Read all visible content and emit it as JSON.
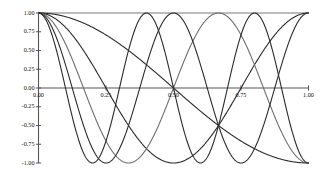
{
  "chart_data": {
    "type": "line",
    "title": "",
    "subtitle": "",
    "xlabel": "",
    "ylabel": "",
    "xlim": [
      0.0,
      1.0
    ],
    "ylim": [
      -1.0,
      1.0
    ],
    "grid": false,
    "legend": "none",
    "background_color": "#ffffff",
    "axis_color": "#555555",
    "x_ticks": [
      0.0,
      0.25,
      0.5,
      0.75,
      1.0
    ],
    "x_tick_labels": [
      "0.00",
      "0.25",
      "0.50",
      "0.75",
      "1.00"
    ],
    "y_ticks": [
      1.0,
      0.75,
      0.5,
      0.25,
      0.0,
      -0.25,
      -0.5,
      -0.75,
      -1.0
    ],
    "y_tick_labels": [
      "1.00",
      "0.75",
      "0.50",
      "0.25",
      "0.00",
      "-0.25",
      "-0.50",
      "-0.75",
      "-1.00"
    ],
    "series": [
      {
        "name": "k=0",
        "k": 0,
        "color": "#7a7a7a",
        "line_width": 1.1,
        "x": [
          0.0,
          0.1,
          0.2,
          0.3,
          0.4,
          0.5,
          0.6,
          0.7,
          0.8,
          0.9,
          1.0
        ],
        "values": [
          1.0,
          1.0,
          1.0,
          1.0,
          1.0,
          1.0,
          1.0,
          1.0,
          1.0,
          1.0,
          1.0
        ]
      },
      {
        "name": "k=1",
        "k": 1,
        "color": "#2b2b2b",
        "line_width": 1.1,
        "x": [
          0.0,
          0.1,
          0.2,
          0.3,
          0.4,
          0.5,
          0.6,
          0.7,
          0.8,
          0.9,
          1.0
        ],
        "values": [
          1.0,
          0.951,
          0.809,
          0.588,
          0.309,
          0.0,
          -0.309,
          -0.588,
          -0.809,
          -0.951,
          -1.0
        ]
      },
      {
        "name": "k=2",
        "k": 2,
        "color": "#2b2b2b",
        "line_width": 1.1,
        "x": [
          0.0,
          0.1,
          0.2,
          0.3,
          0.4,
          0.5,
          0.6,
          0.7,
          0.8,
          0.9,
          1.0
        ],
        "values": [
          1.0,
          0.809,
          0.309,
          -0.309,
          -0.809,
          -1.0,
          -0.809,
          -0.309,
          0.309,
          0.809,
          1.0
        ]
      },
      {
        "name": "k=3",
        "k": 3,
        "color": "#6e6e6e",
        "line_width": 1.1,
        "x": [
          0.0,
          0.1,
          0.2,
          0.3,
          0.4,
          0.5,
          0.6,
          0.7,
          0.8,
          0.9,
          1.0
        ],
        "values": [
          1.0,
          0.588,
          -0.309,
          -0.951,
          -0.809,
          0.0,
          0.809,
          0.951,
          0.309,
          -0.588,
          -1.0
        ]
      },
      {
        "name": "k=4",
        "k": 4,
        "color": "#2b2b2b",
        "line_width": 1.1,
        "x": [
          0.0,
          0.1,
          0.2,
          0.3,
          0.4,
          0.5,
          0.6,
          0.7,
          0.8,
          0.9,
          1.0
        ],
        "values": [
          1.0,
          0.309,
          -0.809,
          -0.809,
          0.309,
          1.0,
          0.309,
          -0.809,
          -0.809,
          0.309,
          1.0
        ]
      },
      {
        "name": "k=5",
        "k": 5,
        "color": "#2b2b2b",
        "line_width": 1.1,
        "x": [
          0.0,
          0.1,
          0.2,
          0.3,
          0.4,
          0.5,
          0.6,
          0.7,
          0.8,
          0.9,
          1.0
        ],
        "values": [
          1.0,
          0.0,
          -1.0,
          0.0,
          1.0,
          0.0,
          -1.0,
          0.0,
          1.0,
          0.0,
          -1.0
        ]
      }
    ]
  },
  "axes": {
    "y_axis_name": "y-axis",
    "x_axis_name": "x-axis"
  }
}
